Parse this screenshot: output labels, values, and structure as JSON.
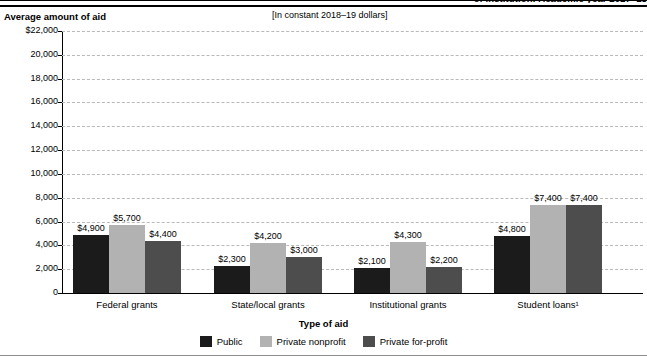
{
  "figure": {
    "title": "of institution: Academic year 2017–18",
    "subtitle": "[In constant 2018–19 dollars]",
    "y_axis_title": "Average amount of aid",
    "x_axis_title": "Type of aid"
  },
  "legend": {
    "items": [
      {
        "label": "Public",
        "color": "#1b1b1b",
        "key": "public"
      },
      {
        "label": "Private nonprofit",
        "color": "#b2b2b2",
        "key": "nonprofit"
      },
      {
        "label": "Private for-profit",
        "color": "#4d4d4d",
        "key": "forprofit"
      }
    ]
  },
  "chart_data": {
    "type": "bar",
    "title": "of institution: Academic year 2017–18",
    "subtitle": "[In constant 2018–19 dollars]",
    "xlabel": "Type of aid",
    "ylabel": "Average amount of aid",
    "ylim": [
      0,
      22000
    ],
    "ytick_step": 2000,
    "ytick_labels": [
      "$22,000",
      "20,000",
      "18,000",
      "16,000",
      "14,000",
      "12,000",
      "10,000",
      "8,000",
      "6,000",
      "4,000",
      "2,000",
      "0"
    ],
    "ytick_values": [
      22000,
      20000,
      18000,
      16000,
      14000,
      12000,
      10000,
      8000,
      6000,
      4000,
      2000,
      0
    ],
    "grid": true,
    "legend_position": "bottom",
    "categories": [
      "Federal grants",
      "State/local grants",
      "Institutional grants",
      "Student loans¹"
    ],
    "series": [
      {
        "name": "Public",
        "color": "#1b1b1b",
        "values": [
          4900,
          2300,
          2100,
          4800
        ],
        "labels": [
          "$4,900",
          "$2,300",
          "$2,100",
          "$4,800"
        ]
      },
      {
        "name": "Private nonprofit",
        "color": "#b2b2b2",
        "values": [
          5700,
          4200,
          4300,
          7400
        ],
        "labels": [
          "$5,700",
          "$4,200",
          "$4,300",
          "$7,400"
        ]
      },
      {
        "name": "Private for-profit",
        "color": "#4d4d4d",
        "values": [
          4400,
          3000,
          2200,
          7400
        ],
        "labels": [
          "$4,400",
          "$3,000",
          "$2,200",
          "$7,400"
        ]
      }
    ]
  }
}
